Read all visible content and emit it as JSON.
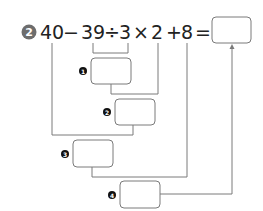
{
  "problem": {
    "number": "2",
    "badge_color": "#6d6d6d",
    "tokens": [
      "40",
      "−",
      "39",
      "÷",
      "3",
      "×",
      "2",
      "+",
      "8",
      "="
    ],
    "answer_value": ""
  },
  "steps": [
    {
      "label": "1",
      "value": ""
    },
    {
      "label": "2",
      "value": ""
    },
    {
      "label": "3",
      "value": ""
    },
    {
      "label": "4",
      "value": ""
    }
  ]
}
